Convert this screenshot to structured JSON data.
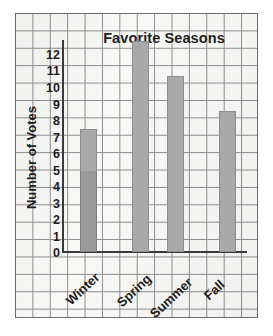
{
  "chart_data": {
    "type": "bar",
    "title": "Favorite Seasons",
    "xlabel": "",
    "ylabel": "Number of Votes",
    "categories": [
      "Winter",
      "Spring",
      "Summer",
      "Fall"
    ],
    "values": [
      7,
      12,
      10,
      8
    ],
    "ylim": [
      0,
      12
    ],
    "ytick_labels": [
      "12",
      "11",
      "10",
      "9",
      "8",
      "7",
      "6",
      "5",
      "4",
      "3",
      "2",
      "1",
      "0"
    ],
    "grid": true,
    "legend": null,
    "bar_color": "#a9a9a9",
    "grid_color": "#8b8b8b",
    "paper_color": "#f8f8f6",
    "axis_color": "#3a3a3a",
    "text_color": "#1d1d1d"
  }
}
